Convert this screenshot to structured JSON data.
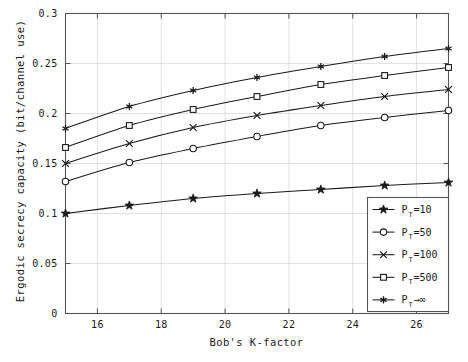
{
  "chart_data": {
    "type": "line",
    "title": "",
    "xlabel": "Bob's K-factor",
    "ylabel": "Ergodic secrecy capacity (bit/channel use)",
    "xlim": [
      15,
      27
    ],
    "ylim": [
      0,
      0.3
    ],
    "xticks": [
      16,
      18,
      20,
      22,
      24,
      26
    ],
    "yticks": [
      0,
      0.05,
      0.1,
      0.15,
      0.2,
      0.25,
      0.3
    ],
    "xtick_labels": [
      "16",
      "18",
      "20",
      "22",
      "24",
      "26"
    ],
    "ytick_labels": [
      "0",
      "0.05",
      "0.1",
      "0.15",
      "0.2",
      "0.25",
      "0.3"
    ],
    "grid": true,
    "legend_position": "lower right",
    "x": [
      15,
      17,
      19,
      21,
      23,
      25,
      27
    ],
    "series": [
      {
        "name": "P_T=10",
        "label": "P",
        "sub": "T",
        "suffix": "=10",
        "marker": "star",
        "values": [
          0.1,
          0.108,
          0.115,
          0.12,
          0.124,
          0.128,
          0.131
        ]
      },
      {
        "name": "P_T=50",
        "label": "P",
        "sub": "T",
        "suffix": "=50",
        "marker": "circle",
        "values": [
          0.132,
          0.151,
          0.165,
          0.177,
          0.188,
          0.196,
          0.203
        ]
      },
      {
        "name": "P_T=100",
        "label": "P",
        "sub": "T",
        "suffix": "=100",
        "marker": "x",
        "values": [
          0.15,
          0.17,
          0.186,
          0.198,
          0.208,
          0.217,
          0.224
        ]
      },
      {
        "name": "P_T=500",
        "label": "P",
        "sub": "T",
        "suffix": "=500",
        "marker": "square",
        "values": [
          0.166,
          0.188,
          0.204,
          0.217,
          0.229,
          0.238,
          0.246
        ]
      },
      {
        "name": "P_T->inf",
        "label": "P",
        "sub": "T",
        "suffix": "→∞",
        "marker": "asterisk",
        "values": [
          0.185,
          0.207,
          0.223,
          0.236,
          0.247,
          0.257,
          0.265
        ]
      }
    ],
    "line_color": "#1a1a1a",
    "grid_color": "#d9d9d9",
    "axis_color": "#555555",
    "background": "#ffffff"
  }
}
